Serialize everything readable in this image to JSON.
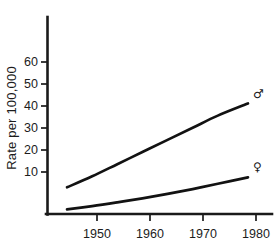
{
  "figure": {
    "background_color": "#ffffff",
    "ink_color": "#1a1a1a"
  },
  "axes": {
    "ylabel": "Rate per 100,000",
    "y_ticks": [
      "60",
      "50",
      "40",
      "30",
      "20",
      "10"
    ],
    "x_ticks": [
      "1950",
      "1960",
      "1970",
      "1980"
    ]
  },
  "series_labels": {
    "male": "♂",
    "female": "♀"
  },
  "chart_data": {
    "type": "line",
    "title": "",
    "xlabel": "",
    "ylabel": "Rate per 100,000",
    "xlim": [
      1944,
      1982
    ],
    "ylim": [
      0,
      68
    ],
    "xticks": [
      1950,
      1960,
      1970,
      1980
    ],
    "yticks": [
      10,
      20,
      30,
      40,
      50,
      60
    ],
    "grid": false,
    "legend": "inline-end-of-line",
    "x": [
      1945,
      1950,
      1955,
      1960,
      1965,
      1970,
      1975,
      1981
    ],
    "series": [
      {
        "name": "♂",
        "label": "Male",
        "values": [
          13,
          18,
          23.5,
          29,
          34.5,
          40,
          45.5,
          51
        ],
        "color": "#121212"
      },
      {
        "name": "♀",
        "label": "Female",
        "values": [
          3,
          4.5,
          6.2,
          8,
          10,
          12.2,
          14.6,
          17.5
        ],
        "color": "#121212"
      }
    ]
  }
}
